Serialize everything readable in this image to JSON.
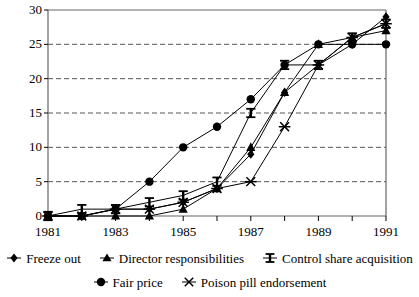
{
  "chart_data": {
    "type": "line",
    "title": "",
    "xlabel": "",
    "ylabel": "",
    "x": [
      1981,
      1982,
      1983,
      1984,
      1985,
      1986,
      1987,
      1988,
      1989,
      1990,
      1991
    ],
    "xlim": [
      1981,
      1991
    ],
    "ylim": [
      0,
      30
    ],
    "ytick_values": [
      0,
      5,
      10,
      15,
      20,
      25,
      30
    ],
    "ytick_labels": [
      "0",
      "5",
      "10",
      "15",
      "20",
      "25",
      "30"
    ],
    "xtick_values": [
      1981,
      1982,
      1983,
      1984,
      1985,
      1986,
      1987,
      1988,
      1989,
      1990,
      1991
    ],
    "xtick_labels": [
      "1981",
      "",
      "1983",
      "",
      "1985",
      "",
      "1987",
      "",
      "1989",
      "",
      "1991"
    ],
    "grid": "horizontal-dashed",
    "legend_position": "below",
    "series": [
      {
        "name": "Freeze out",
        "marker": "diamond",
        "color": "#000000",
        "values": [
          0,
          0,
          1,
          1,
          2,
          4,
          9,
          18,
          22,
          25,
          29
        ]
      },
      {
        "name": "Director responsibilities",
        "marker": "triangle",
        "color": "#000000",
        "values": [
          0,
          0,
          0,
          0,
          1,
          4,
          10,
          18,
          25,
          26,
          27
        ]
      },
      {
        "name": "Control share acquisition",
        "marker": "ibar",
        "color": "#000000",
        "values": [
          0,
          1,
          1,
          2,
          3,
          5,
          15,
          22,
          22,
          26,
          28
        ]
      },
      {
        "name": "Fair price",
        "marker": "circle",
        "color": "#000000",
        "values": [
          0,
          0,
          1,
          5,
          10,
          13,
          17,
          22,
          25,
          25,
          25
        ]
      },
      {
        "name": "Poison pill endorsement",
        "marker": "x",
        "color": "#000000",
        "values": [
          0,
          0,
          1,
          1,
          2,
          4,
          5,
          13,
          22,
          26,
          28
        ]
      }
    ]
  },
  "axes": {
    "y_labels": [
      "30",
      "25",
      "20",
      "15",
      "10",
      "5",
      "0"
    ],
    "x_labels": [
      "1981",
      "1983",
      "1985",
      "1987",
      "1989",
      "1991"
    ]
  },
  "legend": {
    "row1": [
      {
        "label": "Freeze out",
        "marker": "diamond"
      },
      {
        "label": "Director responsibilities",
        "marker": "triangle"
      },
      {
        "label": "Control share acquisition",
        "marker": "ibar"
      }
    ],
    "row2": [
      {
        "label": "Fair price",
        "marker": "circle"
      },
      {
        "label": "Poison pill endorsement",
        "marker": "x"
      }
    ]
  },
  "colors": {
    "line": "#000000",
    "grid": "#555555",
    "axis": "#000000",
    "background": "#ffffff"
  }
}
